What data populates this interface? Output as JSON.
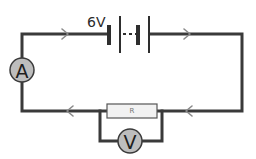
{
  "diagram": {
    "type": "electric-circuit",
    "battery": {
      "label": "6V",
      "cells": 2,
      "connector": "dashed"
    },
    "ammeter": {
      "symbol": "A",
      "position": "left-wire",
      "connection": "series"
    },
    "resistor": {
      "label": "R",
      "position": "bottom-wire",
      "connection": "series"
    },
    "voltmeter": {
      "symbol": "V",
      "position": "below-resistor",
      "connection": "parallel-with-resistor"
    },
    "current_direction_arrows": [
      {
        "segment": "top-left",
        "direction": "right"
      },
      {
        "segment": "top-right",
        "direction": "right"
      },
      {
        "segment": "bottom-left",
        "direction": "left"
      },
      {
        "segment": "bottom-right",
        "direction": "left"
      }
    ],
    "colors": {
      "wire": "#3a3a3a",
      "meter_fill": "#bdbdbd",
      "resistor_fill": "#f2f2f2",
      "arrow": "#8a8a8a",
      "background": "#ffffff"
    }
  }
}
